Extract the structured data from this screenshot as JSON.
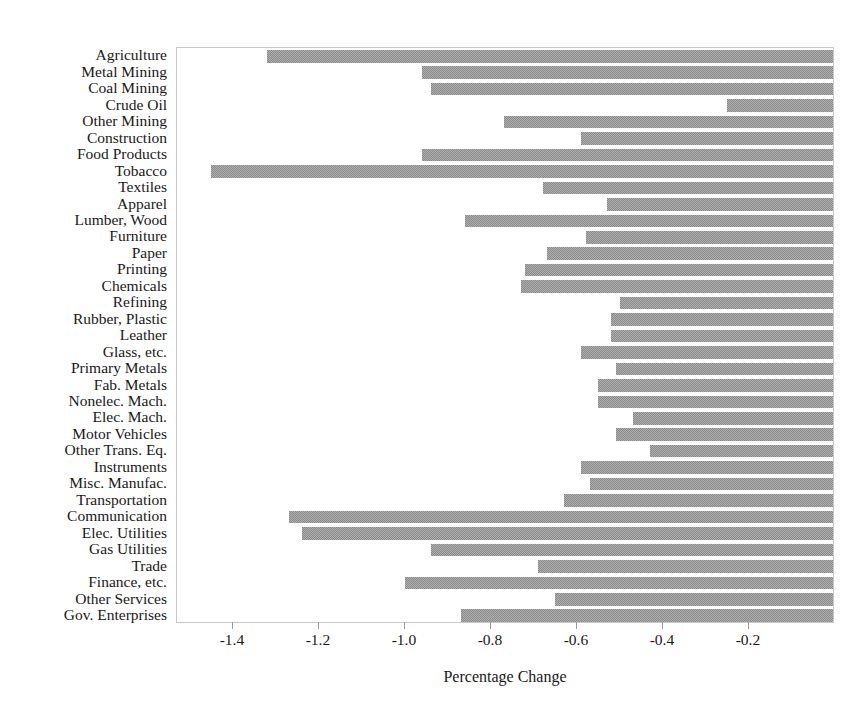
{
  "chart_data": {
    "type": "bar",
    "orientation": "horizontal",
    "title": "",
    "xlabel": "Percentage Change",
    "ylabel": "",
    "xlim": [
      -1.53,
      0.0
    ],
    "xticks": [
      -1.4,
      -1.2,
      -1.0,
      -0.8,
      -0.6,
      -0.4,
      -0.2
    ],
    "xticklabels": [
      "-1.4",
      "-1.2",
      "-1.0",
      "-0.8",
      "-0.6",
      "-0.4",
      "-0.2"
    ],
    "grid": false,
    "legend": null,
    "bar_color": "#8b8b8b",
    "bar_pattern": "dither-hatch",
    "categories": [
      "Agriculture",
      "Metal Mining",
      "Coal Mining",
      "Crude Oil",
      "Other Mining",
      "Construction",
      "Food Products",
      "Tobacco",
      "Textiles",
      "Apparel",
      "Lumber, Wood",
      "Furniture",
      "Paper",
      "Printing",
      "Chemicals",
      "Refining",
      "Rubber, Plastic",
      "Leather",
      "Glass, etc.",
      "Primary Metals",
      "Fab. Metals",
      "Nonelec. Mach.",
      "Elec. Mach.",
      "Motor Vehicles",
      "Other Trans. Eq.",
      "Instruments",
      "Misc. Manufac.",
      "Transportation",
      "Communication",
      "Elec. Utilities",
      "Gas Utilities",
      "Trade",
      "Finance, etc.",
      "Other Services",
      "Gov. Enterprises"
    ],
    "values": [
      -1.32,
      -0.96,
      -0.94,
      -0.25,
      -0.77,
      -0.59,
      -0.96,
      -1.45,
      -0.68,
      -0.53,
      -0.86,
      -0.58,
      -0.67,
      -0.72,
      -0.73,
      -0.5,
      -0.52,
      -0.52,
      -0.59,
      -0.51,
      -0.55,
      -0.55,
      -0.47,
      -0.51,
      -0.43,
      -0.59,
      -0.57,
      -0.63,
      -1.27,
      -1.24,
      -0.94,
      -0.69,
      -1.0,
      -0.65,
      -0.87
    ]
  }
}
